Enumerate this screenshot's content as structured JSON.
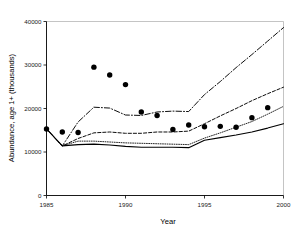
{
  "chart_data": {
    "type": "line",
    "title": "",
    "xlabel": "Year",
    "ylabel": "Abundance, age 1+ (thousands)",
    "xlim": [
      1985,
      2000
    ],
    "ylim": [
      0,
      40000
    ],
    "grid": false,
    "legend": "none",
    "x_ticks": [
      "1985",
      "1990",
      "1995",
      "2000"
    ],
    "x_tick_values": [
      1985,
      1990,
      1995,
      2000
    ],
    "y_ticks": [
      "0",
      "10000",
      "20000",
      "30000",
      "40000"
    ],
    "y_tick_values": [
      0,
      10000,
      20000,
      30000,
      40000
    ],
    "x": [
      1985,
      1986,
      1987,
      1988,
      1989,
      1990,
      1991,
      1992,
      1993,
      1994,
      1995,
      1996,
      1997,
      1998,
      1999,
      2000
    ],
    "series": [
      {
        "name": "dash-dot-upper",
        "style": "dash-dot",
        "values": [
          15300,
          11400,
          16900,
          20300,
          20100,
          18500,
          18400,
          19200,
          19400,
          19300,
          23200,
          26200,
          29400,
          32400,
          35500,
          38600
        ]
      },
      {
        "name": "dashed-middle",
        "style": "dashed",
        "values": [
          15300,
          11400,
          13100,
          14400,
          14600,
          14300,
          14300,
          14600,
          14600,
          14800,
          16500,
          18300,
          20000,
          21800,
          23400,
          24900
        ]
      },
      {
        "name": "dotted-lower",
        "style": "dotted",
        "values": [
          15300,
          11400,
          12500,
          12500,
          12300,
          12100,
          12000,
          11900,
          11800,
          11700,
          13200,
          14400,
          15700,
          17000,
          18700,
          20500
        ]
      },
      {
        "name": "solid-lowest",
        "style": "solid",
        "values": [
          15300,
          11400,
          11700,
          11800,
          11600,
          11300,
          11100,
          11100,
          11100,
          11000,
          12700,
          13300,
          13900,
          14600,
          15500,
          16500
        ]
      }
    ],
    "scatter": {
      "name": "observed-points",
      "marker": "filled-circle",
      "x": [
        1985,
        1986,
        1987,
        1988,
        1989,
        1990,
        1991,
        1992,
        1993,
        1994,
        1995,
        1996,
        1997,
        1998,
        1999
      ],
      "values": [
        15300,
        14600,
        14500,
        29500,
        27700,
        25500,
        19200,
        18400,
        15200,
        16200,
        15800,
        15900,
        15700,
        17900,
        20200
      ]
    }
  }
}
